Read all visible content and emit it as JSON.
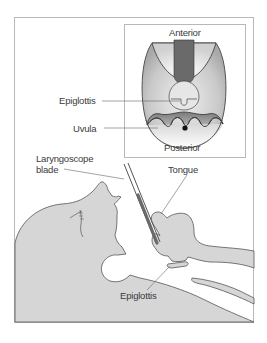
{
  "figure": {
    "inset": {
      "labels": {
        "top": "Anterior",
        "bottom": "Posterior",
        "epiglottis": "Epiglottis",
        "uvula": "Uvula"
      }
    },
    "main": {
      "labels": {
        "blade_line1": "Laryngoscope",
        "blade_line2": "blade",
        "tongue": "Tongue",
        "epiglottis": "Epiglottis"
      }
    },
    "colors": {
      "frame": "#b8b8b8",
      "fill_gray": "#d6d6d6",
      "outline": "#555555",
      "blade": "#6a6a6a",
      "text": "#3a3a3a"
    }
  }
}
